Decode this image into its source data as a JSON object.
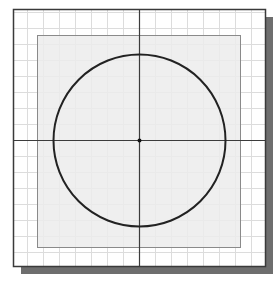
{
  "diagram": {
    "title": "",
    "colors": {
      "background": "#ffffff",
      "grid": "#dcdcdc",
      "frame": "#3a3a3a",
      "shadow": "#6e6e6e",
      "region_fill": "#ececec",
      "region_stroke": "#8a8a8a",
      "axis": "#3c3c3c",
      "circle": "#222222",
      "center_point": "#111111"
    },
    "frame": {
      "x": 13,
      "y": 9,
      "width": 252,
      "height": 257,
      "shadow_offset": 8
    },
    "grid": {
      "spacing": 16,
      "origin_x": 139,
      "origin_y": 140
    },
    "region": {
      "x": 37,
      "y": 35,
      "width": 203,
      "height": 212
    },
    "axes": {
      "center_x": 139,
      "center_y": 140
    },
    "circle": {
      "cx": 139,
      "cy": 140,
      "r": 86
    },
    "center_point": {
      "cx": 139,
      "cy": 140,
      "r": 2
    }
  }
}
